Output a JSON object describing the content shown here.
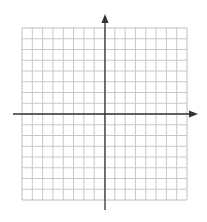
{
  "diagram": {
    "type": "coordinate-plane",
    "grid": {
      "columns": 16,
      "rows": 16,
      "columns_left_of_y_axis": 8,
      "columns_right_of_y_axis": 8,
      "rows_above_x_axis": 8,
      "rows_below_x_axis": 8,
      "left": 22,
      "top": 28,
      "right": 187,
      "bottom": 200,
      "line_color": "#c8c8c8",
      "border_color": "#bdbdbd"
    },
    "x_axis": {
      "y": 114,
      "x_start": 13,
      "x_end": 198,
      "arrow": "right",
      "color": "#333333"
    },
    "y_axis": {
      "x": 105,
      "y_start": 14,
      "y_end": 210,
      "arrow": "up",
      "color": "#333333"
    },
    "labels": []
  }
}
